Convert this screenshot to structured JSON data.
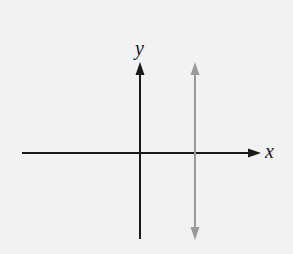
{
  "diagram": {
    "type": "coordinate-axes-with-vertical-line",
    "background": "#f2f2f2",
    "axes": {
      "x_label": "x",
      "y_label": "y",
      "color": "#1a1a1a"
    },
    "vertical_line": {
      "description": "vertical line to the right of the y-axis, double-headed arrow",
      "color": "#9a9a9a"
    }
  }
}
